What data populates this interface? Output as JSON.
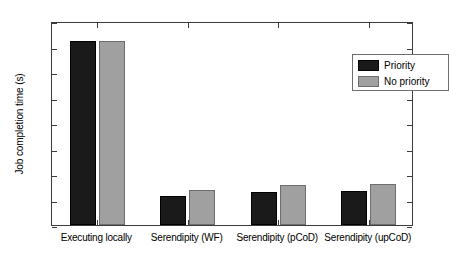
{
  "chart_data": {
    "type": "bar",
    "title": "",
    "xlabel": "",
    "ylabel": "Job completion time (s)",
    "categories": [
      "Executing locally",
      "Serendipity (WF)",
      "Serendipity (pCoD)",
      "Serendipity (upCoD)"
    ],
    "series": [
      {
        "name": "Priority",
        "color": "#1a1a1a",
        "values": [
          7200,
          1140,
          1280,
          1350
        ]
      },
      {
        "name": "No priority",
        "color": "#a0a0a0",
        "values": [
          7200,
          1370,
          1550,
          1620
        ]
      }
    ],
    "ylim": [
      0,
      8000
    ],
    "ytick_labels": [
      "0",
      "1000",
      "2000",
      "3000",
      "4000",
      "5000",
      "6000",
      "7000",
      "8000"
    ],
    "ytick_values": [
      0,
      1000,
      2000,
      3000,
      4000,
      5000,
      6000,
      7000,
      8000
    ],
    "grid": false,
    "legend_position": "top-right",
    "legend_entries": [
      "Priority",
      "No priority"
    ]
  }
}
